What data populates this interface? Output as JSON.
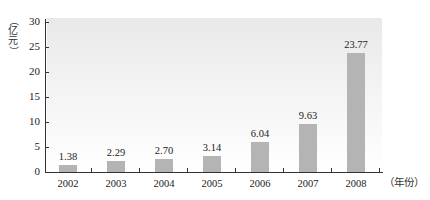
{
  "chart_data": {
    "type": "bar",
    "title": "",
    "xlabel": "（年份）",
    "ylabel": "（亿元）",
    "categories": [
      "2002",
      "2003",
      "2004",
      "2005",
      "2006",
      "2007",
      "2008"
    ],
    "values": [
      1.38,
      2.29,
      2.7,
      3.14,
      6.04,
      9.63,
      23.77
    ],
    "value_labels": [
      "1.38",
      "2.29",
      "2.70",
      "3.14",
      "6.04",
      "9.63",
      "23.77"
    ],
    "ylim": [
      0,
      30
    ],
    "yticks": [
      0,
      5,
      10,
      15,
      20,
      25,
      30
    ],
    "grid": false,
    "legend": null,
    "bar_color": "#b4b4b4",
    "background": "light gray vertical gradient in plot area"
  },
  "axis": {
    "ylabel_chars": [
      "（",
      "亿",
      "元",
      "）"
    ],
    "xlabel": "（年份）"
  }
}
